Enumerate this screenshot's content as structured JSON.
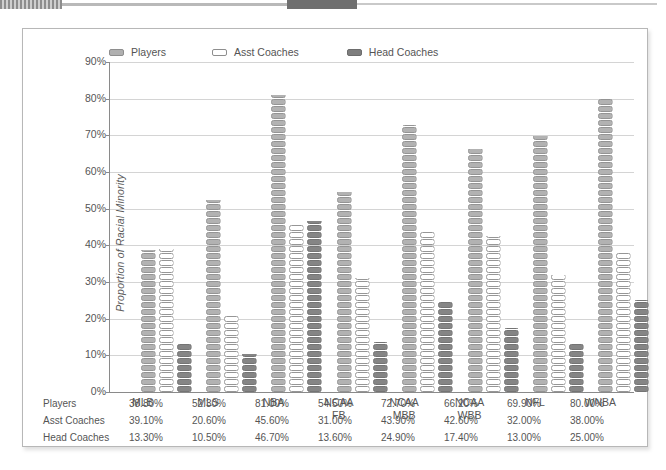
{
  "chart_data": {
    "type": "bar",
    "title": "",
    "subtitle": "",
    "xlabel": "",
    "ylabel": "Proportion of Racial Minority",
    "ylim": [
      0,
      90
    ],
    "ytick_labels": [
      "90%",
      "80%",
      "70%",
      "60%",
      "50%",
      "40%",
      "30%",
      "20%",
      "10%",
      "0%"
    ],
    "ytick_values": [
      90,
      80,
      70,
      60,
      50,
      40,
      30,
      20,
      10,
      0
    ],
    "grid": true,
    "legend_position": "top",
    "categories": [
      "MLB",
      "MLS",
      "NBA",
      "NCAA FB",
      "NCAA MBB",
      "NCAA WBB",
      "NFL",
      "WNBA"
    ],
    "category_lines": [
      [
        "MLB",
        ""
      ],
      [
        "MLS",
        ""
      ],
      [
        "NBA",
        ""
      ],
      [
        "NCAA",
        "FB"
      ],
      [
        "NCAA",
        "MBB"
      ],
      [
        "NCAA",
        "WBB"
      ],
      [
        "NFL",
        ""
      ],
      [
        "WNBA",
        ""
      ]
    ],
    "series": [
      {
        "name": "Players",
        "key": "players",
        "color": "#b2b2b2",
        "values": [
          38.8,
          52.3,
          81.0,
          54.5,
          72.7,
          66.2,
          69.9,
          80.0
        ],
        "labels": [
          "38.80%",
          "52.30%",
          "81.00%",
          "54.50%",
          "72.70%",
          "66.20%",
          "69.90%",
          "80.00%"
        ]
      },
      {
        "name": "Asst Coaches",
        "key": "asst",
        "color": "#ffffff",
        "values": [
          39.1,
          20.6,
          45.6,
          31.0,
          43.9,
          42.6,
          32.0,
          38.0
        ],
        "labels": [
          "39.10%",
          "20.60%",
          "45.60%",
          "31.00%",
          "43.90%",
          "42.60%",
          "32.00%",
          "38.00%"
        ]
      },
      {
        "name": "Head Coaches",
        "key": "head",
        "color": "#858585",
        "values": [
          13.3,
          10.5,
          46.7,
          13.6,
          24.9,
          17.4,
          13.0,
          25.0
        ],
        "labels": [
          "13.30%",
          "10.50%",
          "46.70%",
          "13.60%",
          "24.90%",
          "17.40%",
          "13.00%",
          "25.00%"
        ]
      }
    ]
  },
  "legend": {
    "items": [
      {
        "label": "Players",
        "swatch": "players-swatch-icon"
      },
      {
        "label": "Asst Coaches",
        "swatch": "asst-coaches-swatch-icon"
      },
      {
        "label": "Head Coaches",
        "swatch": "head-coaches-swatch-icon"
      }
    ]
  },
  "axis": {
    "y_title": "Proportion of Racial Minority"
  },
  "table": {
    "rows": [
      {
        "label": "Players",
        "values": [
          "38.80%",
          "52.30%",
          "81.00%",
          "54.50%",
          "72.70%",
          "66.20%",
          "69.90%",
          "80.00%"
        ]
      },
      {
        "label": "Asst Coaches",
        "values": [
          "39.10%",
          "20.60%",
          "45.60%",
          "31.00%",
          "43.90%",
          "42.60%",
          "32.00%",
          "38.00%"
        ]
      },
      {
        "label": "Head Coaches",
        "values": [
          "13.30%",
          "10.50%",
          "46.70%",
          "13.60%",
          "24.90%",
          "17.40%",
          "13.00%",
          "25.00%"
        ]
      }
    ]
  },
  "colors": {
    "players": "#b2b2b2",
    "asst_coaches": "#ffffff",
    "head_coaches": "#858585",
    "gridline": "#d4d4d4",
    "axis": "#8a8a8a",
    "frame_border": "#b7b7b7"
  }
}
